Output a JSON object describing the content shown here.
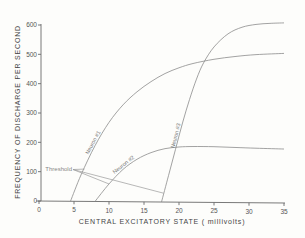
{
  "chart_data": {
    "type": "line",
    "title": "",
    "xlabel": "CENTRAL EXCITATORY STATE ( millivolts)",
    "ylabel": "FREQUENCY OF DISCHARGE PER SECOND",
    "xlim": [
      0,
      35
    ],
    "ylim": [
      0,
      600
    ],
    "xticks": [
      0,
      5,
      10,
      15,
      20,
      25,
      30,
      35
    ],
    "yticks": [
      0,
      100,
      200,
      300,
      400,
      500,
      600
    ],
    "grid": false,
    "series": [
      {
        "name": "Neuron #1",
        "label": "Neuron #1",
        "x": [
          4.5,
          6,
          8,
          10,
          12,
          14,
          16,
          18,
          20,
          22,
          25,
          28,
          31,
          35
        ],
        "y": [
          0,
          90,
          190,
          270,
          330,
          375,
          410,
          438,
          458,
          473,
          488,
          498,
          505,
          510
        ]
      },
      {
        "name": "Neuron #2",
        "label": "Neuron #2",
        "x": [
          8,
          10,
          12,
          14,
          16,
          18,
          20,
          22,
          25,
          28,
          31,
          35
        ],
        "y": [
          0,
          60,
          110,
          145,
          168,
          182,
          188,
          190,
          190,
          188,
          186,
          184
        ]
      },
      {
        "name": "Neuron #3",
        "label": "Neuron #3",
        "x": [
          17.5,
          18.5,
          19.5,
          20.5,
          21.5,
          22.5,
          23.5,
          25,
          27,
          29,
          31,
          33,
          35
        ],
        "y": [
          0,
          90,
          180,
          270,
          350,
          420,
          475,
          530,
          575,
          598,
          608,
          612,
          614
        ]
      }
    ],
    "annotations": [
      {
        "text": "Threshold",
        "points_to": [
          {
            "series": "Neuron #1",
            "x": 6.5,
            "y": 110
          },
          {
            "series": "Neuron #2",
            "x": 10,
            "y": 60
          },
          {
            "series": "Neuron #3",
            "x": 17.8,
            "y": 30
          }
        ]
      }
    ]
  }
}
